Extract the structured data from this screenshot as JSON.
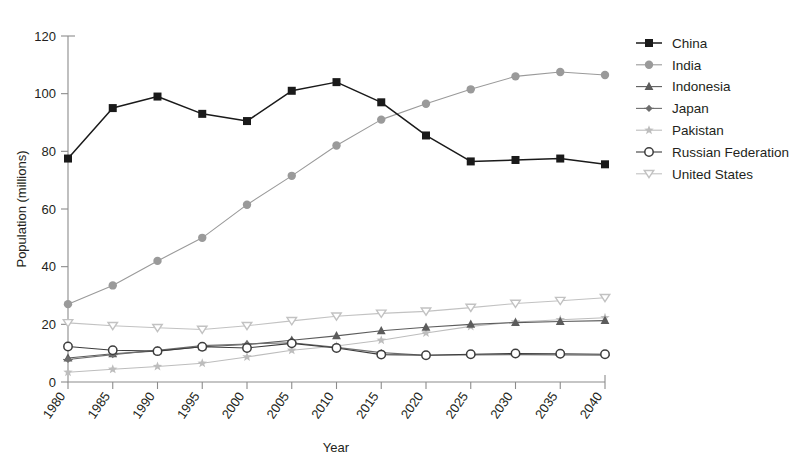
{
  "chart_data": {
    "type": "line",
    "title": "",
    "xlabel": "Year",
    "ylabel": "Population (millions)",
    "x": [
      1980,
      1985,
      1990,
      1995,
      2000,
      2005,
      2010,
      2015,
      2020,
      2025,
      2030,
      2035,
      2040
    ],
    "categories": [
      "1980",
      "1985",
      "1990",
      "1995",
      "2000",
      "2005",
      "2010",
      "2015",
      "2020",
      "2025",
      "2030",
      "2035",
      "2040"
    ],
    "xlim": [
      1980,
      2040
    ],
    "ylim": [
      0,
      120
    ],
    "yticks": [
      0,
      20,
      40,
      60,
      80,
      100,
      120
    ],
    "ytick_labels": [
      "0",
      "20",
      "40",
      "60",
      "80",
      "100",
      "120"
    ],
    "grid": false,
    "legend_position": "right",
    "series": [
      {
        "name": "China",
        "color": "#1a1a1a",
        "marker": "filled-square",
        "values": [
          77.5,
          95.0,
          99.0,
          93.0,
          90.5,
          101.0,
          104.0,
          97.0,
          85.5,
          76.5,
          77.0,
          77.5,
          75.5
        ]
      },
      {
        "name": "India",
        "color": "#9a9a9a",
        "marker": "filled-circle",
        "values": [
          27.0,
          33.5,
          42.0,
          50.0,
          61.5,
          71.5,
          82.0,
          91.0,
          96.5,
          101.5,
          106.0,
          107.5,
          106.5
        ]
      },
      {
        "name": "Indonesia",
        "color": "#5c5c5c",
        "marker": "filled-triangle-up",
        "values": [
          8.3,
          9.8,
          10.8,
          12.2,
          13.0,
          14.5,
          16.0,
          17.8,
          19.0,
          20.0,
          20.6,
          21.0,
          21.3
        ]
      },
      {
        "name": "Japan",
        "color": "#6e6e6e",
        "marker": "filled-diamond",
        "values": [
          7.8,
          9.5,
          11.0,
          12.6,
          13.2,
          13.6,
          12.0,
          10.2,
          9.3,
          9.4,
          9.5,
          9.4,
          9.3
        ]
      },
      {
        "name": "Pakistan",
        "color": "#bdbdbd",
        "marker": "star",
        "values": [
          3.4,
          4.4,
          5.4,
          6.5,
          8.7,
          11.0,
          12.5,
          14.5,
          17.0,
          19.3,
          20.8,
          21.6,
          22.3
        ]
      },
      {
        "name": "Russian Federation",
        "color": "#3d3d3d",
        "marker": "open-circle",
        "values": [
          12.3,
          11.0,
          10.7,
          12.2,
          11.8,
          13.4,
          11.8,
          9.5,
          9.3,
          9.6,
          9.9,
          9.8,
          9.6
        ]
      },
      {
        "name": "United States",
        "color": "#c2c2c2",
        "marker": "open-triangle-down",
        "values": [
          20.5,
          19.5,
          18.8,
          18.2,
          19.5,
          21.2,
          22.8,
          23.8,
          24.5,
          25.8,
          27.2,
          28.2,
          29.2
        ]
      }
    ]
  },
  "legend": {
    "entries": [
      {
        "label": "China"
      },
      {
        "label": "India"
      },
      {
        "label": "Indonesia"
      },
      {
        "label": "Japan"
      },
      {
        "label": "Pakistan"
      },
      {
        "label": "Russian Federation"
      },
      {
        "label": "United States"
      }
    ]
  }
}
